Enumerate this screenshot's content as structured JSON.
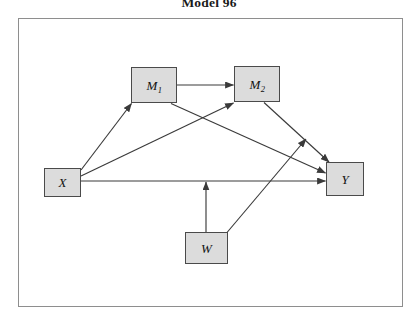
{
  "figure": {
    "title": "Model 96",
    "frame_color": "#8e8e8e",
    "node_fill": "#dcdcdc",
    "node_border": "#4a4a4a",
    "edge_color": "#3a3a3a",
    "background": "#ffffff"
  },
  "nodes": [
    {
      "id": "X",
      "label": "X",
      "sub": "",
      "name": "node-x"
    },
    {
      "id": "M1",
      "label": "M",
      "sub": "1",
      "name": "node-m1"
    },
    {
      "id": "M2",
      "label": "M",
      "sub": "2",
      "name": "node-m2"
    },
    {
      "id": "Y",
      "label": "Y",
      "sub": "",
      "name": "node-y"
    },
    {
      "id": "W",
      "label": "W",
      "sub": "",
      "name": "node-w"
    }
  ],
  "edges": [
    {
      "from": "X",
      "to": "M1",
      "type": "direct"
    },
    {
      "from": "X",
      "to": "M2",
      "type": "direct"
    },
    {
      "from": "X",
      "to": "Y",
      "type": "direct"
    },
    {
      "from": "M1",
      "to": "M2",
      "type": "direct"
    },
    {
      "from": "M1",
      "to": "Y",
      "type": "direct"
    },
    {
      "from": "M2",
      "to": "Y",
      "type": "direct"
    },
    {
      "from": "W",
      "to": "Y",
      "type": "direct"
    },
    {
      "from": "W",
      "to": "X->Y",
      "type": "moderation"
    }
  ]
}
